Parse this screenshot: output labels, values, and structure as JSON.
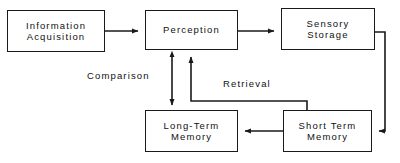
{
  "diagram": {
    "type": "flow-diagram",
    "canvas": {
      "width": 400,
      "height": 163
    },
    "colors": {
      "background": "#ffffff",
      "stroke": "#1a1a1a",
      "text": "#111111"
    },
    "nodes": [
      {
        "id": "information-acquisition",
        "line1": "Information",
        "line2": "Acquisition",
        "x": 7,
        "y": 10,
        "w": 98,
        "h": 42
      },
      {
        "id": "perception",
        "line1": "Perception",
        "line2": "",
        "x": 145,
        "y": 10,
        "w": 93,
        "h": 40
      },
      {
        "id": "sensory-storage",
        "line1": "Sensory",
        "line2": "Storage",
        "x": 281,
        "y": 8,
        "w": 94,
        "h": 42
      },
      {
        "id": "long-term-memory",
        "line1": "Long-Term",
        "line2": "Memory",
        "x": 145,
        "y": 110,
        "w": 93,
        "h": 42
      },
      {
        "id": "short-term-memory",
        "line1": "Short Term",
        "line2": "Memory",
        "x": 283,
        "y": 110,
        "w": 89,
        "h": 42
      }
    ],
    "edge_labels": [
      {
        "id": "comparison",
        "text": "Comparison",
        "x": 85,
        "y": 70
      },
      {
        "id": "retrieval",
        "text": "Retrieval",
        "x": 221,
        "y": 78
      }
    ],
    "connections": [
      {
        "id": "acquisition-to-perception",
        "from": "information-acquisition",
        "to": "perception",
        "style": "single-arrow"
      },
      {
        "id": "perception-to-sensory",
        "from": "perception",
        "to": "sensory-storage",
        "style": "single-arrow"
      },
      {
        "id": "sensory-to-short-term",
        "from": "sensory-storage",
        "to": "short-term-memory",
        "style": "single-arrow-routed"
      },
      {
        "id": "short-term-to-long-term",
        "from": "short-term-memory",
        "to": "long-term-memory",
        "style": "single-arrow"
      },
      {
        "id": "comparison-link",
        "from": "perception",
        "to": "long-term-memory",
        "style": "double-arrow",
        "label": "Comparison"
      },
      {
        "id": "retrieval-link",
        "from": "short-term-memory",
        "to": "perception",
        "style": "single-arrow-routed",
        "label": "Retrieval"
      }
    ]
  }
}
